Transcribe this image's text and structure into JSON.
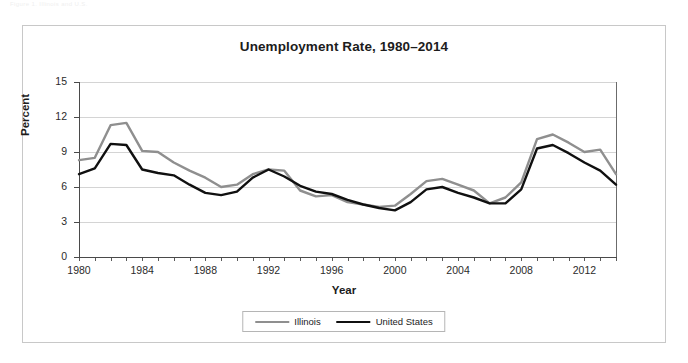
{
  "caption": "Figure 1.  Illinois and U.S.",
  "figure": {
    "axis_title_y": "Percent",
    "axis_title_x": "Year"
  },
  "legend": {
    "position": "bottom",
    "entries": [
      {
        "label": "Illinois",
        "color": "#8f8f8f"
      },
      {
        "label": "United States",
        "color": "#101010"
      }
    ]
  },
  "chart_data": {
    "type": "line",
    "title": "Unemployment Rate, 1980–2014",
    "xlabel": "Year",
    "ylabel": "Percent",
    "xlim": [
      1980,
      2014
    ],
    "ylim": [
      0,
      15
    ],
    "ytick_values": [
      0,
      3,
      6,
      9,
      12,
      15
    ],
    "ytick_labels": [
      "0",
      "3",
      "6",
      "9",
      "12",
      "15"
    ],
    "xtick_values": [
      1980,
      1984,
      1988,
      1992,
      1996,
      2000,
      2004,
      2008,
      2012
    ],
    "xtick_labels": [
      "1980",
      "1984",
      "1988",
      "1992",
      "1996",
      "2000",
      "2004",
      "2008",
      "2012"
    ],
    "grid": "horizontal",
    "x": [
      1980,
      1981,
      1982,
      1983,
      1984,
      1985,
      1986,
      1987,
      1988,
      1989,
      1990,
      1991,
      1992,
      1993,
      1994,
      1995,
      1996,
      1997,
      1998,
      1999,
      2000,
      2001,
      2002,
      2003,
      2004,
      2005,
      2006,
      2007,
      2008,
      2009,
      2010,
      2011,
      2012,
      2013,
      2014
    ],
    "series": [
      {
        "name": "Illinois",
        "color": "#8f8f8f",
        "values": [
          8.3,
          8.5,
          11.3,
          11.5,
          9.1,
          9.0,
          8.1,
          7.4,
          6.8,
          6.0,
          6.2,
          7.1,
          7.5,
          7.4,
          5.7,
          5.2,
          5.3,
          4.7,
          4.5,
          4.3,
          4.4,
          5.4,
          6.5,
          6.7,
          6.2,
          5.7,
          4.6,
          5.1,
          6.4,
          10.1,
          10.5,
          9.8,
          9.0,
          9.2,
          7.1
        ]
      },
      {
        "name": "United States",
        "color": "#101010",
        "values": [
          7.1,
          7.6,
          9.7,
          9.6,
          7.5,
          7.2,
          7.0,
          6.2,
          5.5,
          5.3,
          5.6,
          6.8,
          7.5,
          6.9,
          6.1,
          5.6,
          5.4,
          4.9,
          4.5,
          4.2,
          4.0,
          4.7,
          5.8,
          6.0,
          5.5,
          5.1,
          4.6,
          4.6,
          5.8,
          9.3,
          9.6,
          8.9,
          8.1,
          7.4,
          6.2
        ]
      }
    ]
  }
}
